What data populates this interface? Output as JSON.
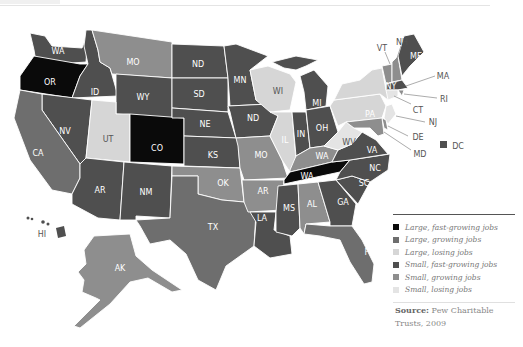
{
  "header": {
    "fragment_text": ""
  },
  "colors": {
    "large_fast": "#0a0a0a",
    "large_growing": "#6e6e6e",
    "large_losing": "#d6d6d6",
    "small_fast": "#4f4f4f",
    "small_growing": "#8e8e8e",
    "small_losing": "#e4e4e4"
  },
  "map": {
    "states": [
      {
        "label": "WA",
        "category": "small_fast"
      },
      {
        "label": "OR",
        "category": "large_fast"
      },
      {
        "label": "ID",
        "category": "small_fast"
      },
      {
        "label": "MO",
        "category": "small_growing"
      },
      {
        "label": "WY",
        "category": "small_fast"
      },
      {
        "label": "NV",
        "category": "small_fast"
      },
      {
        "label": "CA",
        "category": "large_growing"
      },
      {
        "label": "UT",
        "category": "large_losing"
      },
      {
        "label": "CO",
        "category": "large_fast"
      },
      {
        "label": "AR",
        "category": "small_fast"
      },
      {
        "label": "NM",
        "category": "small_fast"
      },
      {
        "label": "ND",
        "category": "small_fast"
      },
      {
        "label": "SD",
        "category": "small_fast"
      },
      {
        "label": "NE",
        "category": "small_fast"
      },
      {
        "label": "KS",
        "category": "small_fast"
      },
      {
        "label": "OK",
        "category": "small_growing"
      },
      {
        "label": "TX",
        "category": "large_growing"
      },
      {
        "label": "MN",
        "category": "small_fast"
      },
      {
        "label": "ND",
        "category": "small_fast"
      },
      {
        "label": "MO",
        "category": "small_growing"
      },
      {
        "label": "AR",
        "category": "small_growing"
      },
      {
        "label": "LA",
        "category": "small_fast"
      },
      {
        "label": "WI",
        "category": "large_losing"
      },
      {
        "label": "IL",
        "category": "large_losing"
      },
      {
        "label": "MI",
        "category": "small_fast"
      },
      {
        "label": "IN",
        "category": "small_fast"
      },
      {
        "label": "OH",
        "category": "small_fast"
      },
      {
        "label": "WA",
        "category": "small_growing"
      },
      {
        "label": "WA",
        "category": "large_fast"
      },
      {
        "label": "MS",
        "category": "small_fast"
      },
      {
        "label": "AL",
        "category": "small_growing"
      },
      {
        "label": "GA",
        "category": "small_fast"
      },
      {
        "label": "FL",
        "category": "large_growing"
      },
      {
        "label": "SC",
        "category": "small_fast"
      },
      {
        "label": "NC",
        "category": "small_fast"
      },
      {
        "label": "VA",
        "category": "small_fast"
      },
      {
        "label": "WV",
        "category": "small_losing"
      },
      {
        "label": "PA",
        "category": "large_losing"
      },
      {
        "label": "NY",
        "category": "large_losing"
      },
      {
        "label": "VT",
        "category": "small_growing"
      },
      {
        "label": "NH",
        "category": "small_growing"
      },
      {
        "label": "ME",
        "category": "small_fast"
      },
      {
        "label": "MA",
        "category": "small_fast"
      },
      {
        "label": "RI",
        "category": "small_growing"
      },
      {
        "label": "CT",
        "category": "small_losing"
      },
      {
        "label": "NJ",
        "category": "small_losing"
      },
      {
        "label": "DE",
        "category": "small_growing"
      },
      {
        "label": "MD",
        "category": "small_growing"
      },
      {
        "label": "DC",
        "category": "small_fast"
      },
      {
        "label": "AK",
        "category": "small_growing"
      },
      {
        "label": "HI",
        "category": "small_fast"
      }
    ],
    "labels": {
      "wa": "WA",
      "or": "OR",
      "id": "ID",
      "mt": "MO",
      "wy": "WY",
      "nv": "NV",
      "ca": "CA",
      "ut": "UT",
      "co": "CO",
      "az": "AR",
      "nm": "NM",
      "nd": "ND",
      "sd": "SD",
      "ne": "NE",
      "ks": "KS",
      "ok": "OK",
      "tx": "TX",
      "mn": "MN",
      "ia": "ND",
      "mo": "MO",
      "ar": "AR",
      "la": "LA",
      "wi": "WI",
      "il": "IL",
      "mi": "MI",
      "in": "IN",
      "oh": "OH",
      "ky": "WA",
      "tn": "WA",
      "ms": "MS",
      "al": "AL",
      "ga": "GA",
      "fl": "FL",
      "sc": "SC",
      "nc": "NC",
      "va": "VA",
      "wv": "WV",
      "pa": "PA",
      "ny": "NY",
      "vt": "VT",
      "nh": "NH",
      "me": "ME",
      "ma": "MA",
      "ri": "RI",
      "ct": "CT",
      "nj": "NJ",
      "de": "DE",
      "md": "MD",
      "dc": "DC",
      "ak": "AK",
      "hi": "HI"
    }
  },
  "legend": {
    "items": [
      {
        "label": "Large, fast-growing jobs",
        "color": "#0a0a0a"
      },
      {
        "label": "Large, growing jobs",
        "color": "#6e6e6e"
      },
      {
        "label": "Large, losing jobs",
        "color": "#d6d6d6"
      },
      {
        "label": "Small, fast-growing jobs",
        "color": "#4f4f4f"
      },
      {
        "label": "Small, growing jobs",
        "color": "#8e8e8e"
      },
      {
        "label": "Small, losing jobs",
        "color": "#e4e4e4"
      }
    ]
  },
  "source": {
    "prefix": "Source:",
    "text": " Pew Charitable Trusts, 2009"
  }
}
